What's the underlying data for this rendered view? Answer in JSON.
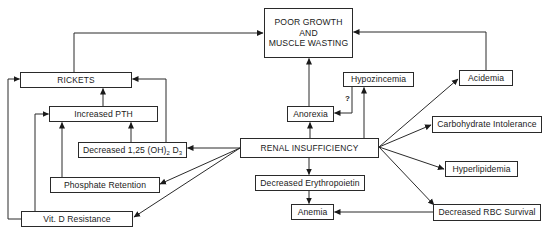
{
  "diagram": {
    "title_node": {
      "lines": [
        "POOR GROWTH",
        "AND",
        "MUSCLE WASTING"
      ]
    },
    "nodes": {
      "rickets": "RICKETS",
      "increased_pth": "Increased PTH",
      "decreased_vitd_prefix": "Decreased 1,25 (OH)",
      "decreased_vitd_sub1": "2",
      "decreased_vitd_mid": " D",
      "decreased_vitd_sub2": "3",
      "phosphate_retention": "Phosphate Retention",
      "vitd_resistance": "Vit. D Resistance",
      "renal_insufficiency": "RENAL INSUFFICIENCY",
      "anorexia": "Anorexia",
      "hypozincemia": "Hypozincemia",
      "acidemia": "Acidemia",
      "carbohydrate_intolerance": "Carbohydrate Intolerance",
      "hyperlipidemia": "Hyperlipidemia",
      "decreased_erythropoietin": "Decreased Erythropoietin",
      "anemia": "Anemia",
      "decreased_rbc_survival": "Decreased RBC Survival"
    },
    "annotations": {
      "uncertain_link": "?"
    },
    "edges": [
      {
        "from": "Renal Insufficiency",
        "to": "Decreased 1,25 (OH)2 D3"
      },
      {
        "from": "Renal Insufficiency",
        "to": "Phosphate Retention"
      },
      {
        "from": "Renal Insufficiency",
        "to": "Vit. D Resistance"
      },
      {
        "from": "Renal Insufficiency",
        "to": "Anorexia"
      },
      {
        "from": "Renal Insufficiency",
        "to": "Hypozincemia"
      },
      {
        "from": "Renal Insufficiency",
        "to": "Acidemia"
      },
      {
        "from": "Renal Insufficiency",
        "to": "Carbohydrate Intolerance"
      },
      {
        "from": "Renal Insufficiency",
        "to": "Hyperlipidemia"
      },
      {
        "from": "Renal Insufficiency",
        "to": "Decreased RBC Survival"
      },
      {
        "from": "Renal Insufficiency",
        "to": "Decreased Erythropoietin"
      },
      {
        "from": "Decreased Erythropoietin",
        "to": "Anemia"
      },
      {
        "from": "Decreased RBC Survival",
        "to": "Anemia"
      },
      {
        "from": "Hypozincemia",
        "to": "Anorexia",
        "label": "?"
      },
      {
        "from": "Anorexia",
        "to": "Poor Growth and Muscle Wasting"
      },
      {
        "from": "Acidemia",
        "to": "Poor Growth and Muscle Wasting"
      },
      {
        "from": "Rickets",
        "to": "Poor Growth and Muscle Wasting"
      },
      {
        "from": "Increased PTH",
        "to": "Rickets"
      },
      {
        "from": "Decreased 1,25 (OH)2 D3",
        "to": "Increased PTH"
      },
      {
        "from": "Decreased 1,25 (OH)2 D3",
        "to": "Rickets"
      },
      {
        "from": "Phosphate Retention",
        "to": "Increased PTH"
      },
      {
        "from": "Vit. D Resistance",
        "to": "Increased PTH"
      },
      {
        "from": "Vit. D Resistance",
        "to": "Rickets"
      }
    ],
    "colors": {
      "line": "#2a2a2a",
      "background": "#ffffff"
    }
  }
}
